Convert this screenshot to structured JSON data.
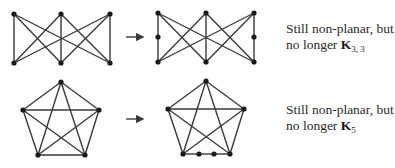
{
  "figure": {
    "rows": [
      {
        "name": "k33-row",
        "caption": {
          "line1": "Still non-planar, but",
          "line2_prefix": "no longer ",
          "graph_symbol": "K",
          "graph_subscript": "3, 3"
        },
        "original_graph": {
          "type": "K3,3",
          "nodes": [
            [
              14,
              14
            ],
            [
              61,
              14
            ],
            [
              110,
              14
            ],
            [
              14,
              63
            ],
            [
              61,
              63
            ],
            [
              110,
              63
            ]
          ],
          "edges": [
            [
              0,
              3
            ],
            [
              0,
              4
            ],
            [
              0,
              5
            ],
            [
              1,
              3
            ],
            [
              1,
              4
            ],
            [
              1,
              5
            ],
            [
              2,
              3
            ],
            [
              2,
              4
            ],
            [
              2,
              5
            ]
          ]
        },
        "arrow": {
          "x1": 126,
          "x2": 143,
          "y": 37,
          "symbol": "→"
        },
        "subdivided_graph": {
          "type": "K3,3 subdivision",
          "nodes": [
            [
              158,
              13
            ],
            [
              206,
              13
            ],
            [
              254,
              13
            ],
            [
              158,
              62
            ],
            [
              206,
              62
            ],
            [
              254,
              62
            ],
            [
              158,
              37
            ],
            [
              254,
              37
            ]
          ],
          "edges": [
            [
              0,
              6
            ],
            [
              6,
              3
            ],
            [
              0,
              4
            ],
            [
              0,
              5
            ],
            [
              1,
              3
            ],
            [
              1,
              4
            ],
            [
              1,
              5
            ],
            [
              2,
              3
            ],
            [
              2,
              4
            ],
            [
              2,
              7
            ],
            [
              7,
              5
            ]
          ]
        }
      },
      {
        "name": "k5-row",
        "caption": {
          "line1": "Still non-planar, but",
          "line2_prefix": "no longer ",
          "graph_symbol": "K",
          "graph_subscript": "5"
        },
        "original_graph": {
          "type": "K5",
          "nodes": [
            [
              61,
              82
            ],
            [
              23,
              110
            ],
            [
              99,
              110
            ],
            [
              38,
              155
            ],
            [
              85,
              155
            ]
          ],
          "edges": [
            [
              0,
              1
            ],
            [
              0,
              2
            ],
            [
              0,
              3
            ],
            [
              0,
              4
            ],
            [
              1,
              2
            ],
            [
              1,
              3
            ],
            [
              1,
              4
            ],
            [
              2,
              3
            ],
            [
              2,
              4
            ],
            [
              3,
              4
            ]
          ]
        },
        "arrow": {
          "x1": 126,
          "x2": 143,
          "y": 119,
          "symbol": "→"
        },
        "subdivided_graph": {
          "type": "K5 subdivision",
          "nodes": [
            [
              206,
              81
            ],
            [
              168,
              109
            ],
            [
              244,
              109
            ],
            [
              183,
              154
            ],
            [
              230,
              154
            ],
            [
              199,
              154
            ],
            [
              214,
              154
            ]
          ],
          "edges": [
            [
              0,
              1
            ],
            [
              0,
              2
            ],
            [
              0,
              3
            ],
            [
              0,
              4
            ],
            [
              1,
              2
            ],
            [
              1,
              3
            ],
            [
              1,
              4
            ],
            [
              2,
              3
            ],
            [
              2,
              4
            ],
            [
              3,
              5
            ],
            [
              5,
              6
            ],
            [
              6,
              4
            ]
          ]
        }
      }
    ],
    "colors": {
      "edge": "#3a3a3a",
      "node": "#1a1a1a",
      "text": "#2a2a2a"
    }
  }
}
